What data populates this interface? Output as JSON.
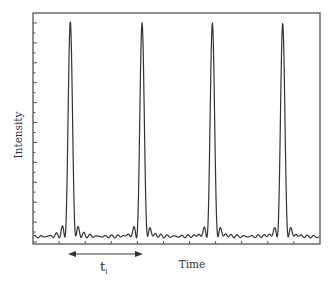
{
  "chart_data": {
    "type": "line",
    "title": "",
    "xlabel": "Time",
    "ylabel": "Intensity",
    "x_tick_labels": [],
    "y_tick_labels": [],
    "grid": false,
    "legend": null,
    "series": [
      {
        "name": "pulse train",
        "peaks_relative_x": [
          0.13,
          0.38,
          0.625,
          0.87
        ],
        "peak_height_relative": 1.0,
        "baseline_relative": 0.03,
        "sidelobe_relative": 0.1
      }
    ],
    "annotations": [
      {
        "type": "double-arrow",
        "label": "t",
        "subscript": "i",
        "meaning": "period between adjacent peaks",
        "from_peak": 1,
        "to_peak": 2
      }
    ],
    "axis": {
      "x_ticks": 11,
      "y_major_ticks": 11,
      "y_minor_ticks": true
    },
    "color": "#333333"
  },
  "labels": {
    "xlabel": "Time",
    "ylabel": "Intensity",
    "period_main": "t",
    "period_sub": "i"
  }
}
